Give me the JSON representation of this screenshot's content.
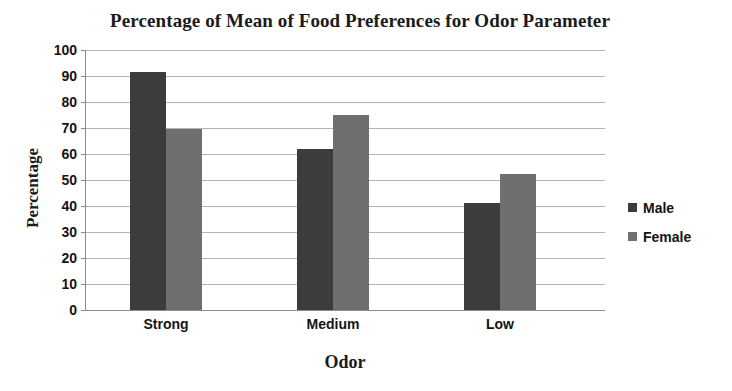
{
  "chart_data": {
    "type": "bar",
    "title": "Percentage of Mean of Food Preferences for Odor Parameter",
    "xlabel": "Odor",
    "ylabel": "Percentage",
    "categories": [
      "Strong",
      "Medium",
      "Low"
    ],
    "series": [
      {
        "name": "Male",
        "color": "#3c3c3c",
        "values": [
          91.5,
          62,
          41
        ]
      },
      {
        "name": "Female",
        "color": "#6f6f6f",
        "values": [
          69.5,
          75,
          52.5
        ]
      }
    ],
    "ylim": [
      0,
      100
    ],
    "ytick_step": 10,
    "yticks": [
      100,
      90,
      80,
      70,
      60,
      50,
      40,
      30,
      20,
      10,
      0
    ],
    "ytick_labels": [
      "100",
      "90",
      "80",
      "70",
      "60",
      "50",
      "40",
      "30",
      "20",
      "10",
      "0"
    ],
    "grid": true,
    "legend_position": "right"
  },
  "legend": {
    "items": [
      {
        "label": "Male",
        "color": "#3c3c3c"
      },
      {
        "label": "Female",
        "color": "#6f6f6f"
      }
    ]
  }
}
